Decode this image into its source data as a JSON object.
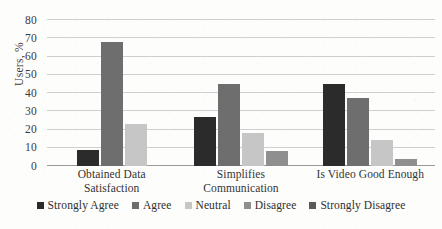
{
  "chart_data": {
    "type": "bar",
    "title": "",
    "xlabel": "",
    "ylabel": "Users, %",
    "ylim": [
      0,
      80
    ],
    "yticks": [
      0,
      10,
      20,
      30,
      40,
      50,
      60,
      70,
      80
    ],
    "ytick_labels": [
      "0",
      "10",
      "20",
      "30",
      "40",
      "50",
      "60",
      "70",
      "80"
    ],
    "grid": true,
    "legend_position": "bottom",
    "grouping": "grouped",
    "categories": [
      "Obtained Data Satisfaction",
      "Simplifies Communication",
      "Is Video Good Enough"
    ],
    "category_lines": [
      [
        "Obtained Data",
        "Satisfaction"
      ],
      [
        "Simplifies",
        "Communication"
      ],
      [
        "Is Video Good Enough"
      ]
    ],
    "series": [
      {
        "name": "Strongly Agree",
        "color": "#2b2b2b",
        "values": [
          9,
          27,
          45
        ]
      },
      {
        "name": "Agree",
        "color": "#6e6e6e",
        "values": [
          68,
          45,
          37
        ]
      },
      {
        "name": "Neutral",
        "color": "#c6c6c6",
        "values": [
          23,
          18,
          14
        ]
      },
      {
        "name": "Disagree",
        "color": "#8f8f8f",
        "values": [
          0,
          8,
          4
        ]
      },
      {
        "name": "Strongly Disagree",
        "color": "#5a5a5a",
        "values": [
          0,
          0,
          0
        ]
      }
    ],
    "colors": {
      "gridline": "#cfcfcf",
      "baseline": "#9a9a9a",
      "text": "#333333",
      "background": "#fdfdfc"
    }
  }
}
